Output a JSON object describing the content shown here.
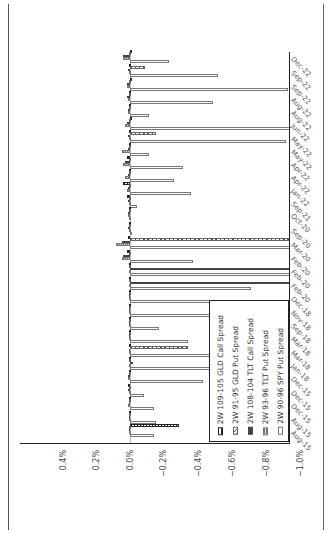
{
  "page": {
    "rotation": "90deg counter-clockwise"
  },
  "chart_data": {
    "type": "bar",
    "orientation": "rotated page; value axis horizontal along bottom, date axis vertical along right edge",
    "title": "",
    "xlabel": "",
    "ylabel": "",
    "ylim": [
      -1.0,
      0.4
    ],
    "y_ticks": [
      "0.4%",
      "0.2%",
      "0.0%",
      "−0.2%",
      "−0.4%",
      "−0.6%",
      "−0.8%",
      "−1.0%"
    ],
    "grid": false,
    "legend_position": "lower right (inside plot, rotated)",
    "categories": [
      "Dec-22",
      "Sep-22",
      "Sep-22",
      "Aug-22",
      "Aug-22",
      "Jun-22",
      "May-22",
      "May-22",
      "Apr-22",
      "Apr-22",
      "Jan-22",
      "Sep-21",
      "Oct-20",
      "Sep-20",
      "Mar-20",
      "Feb-20",
      "Feb-20",
      "Feb-20",
      "Dec-18",
      "Nov-18",
      "Sep-18",
      "Mar-18",
      "Mar-18",
      "Jan-18",
      "Dec-15",
      "Dec-15",
      "Dec-15",
      "Aug-15",
      "Aug-15"
    ],
    "series": [
      {
        "name": "2W 109-105 GLD Call Spread",
        "pattern": "dotted",
        "values": [
          -0.01,
          0.0,
          -0.01,
          0.0,
          0.0,
          -0.01,
          0.0,
          0.0,
          0.02,
          0.0,
          0.04,
          0.02,
          0.0,
          0.0,
          0.01,
          0.02,
          0.0,
          0.0,
          0.0,
          0.0,
          0.0,
          0.0,
          0.0,
          0.0,
          0.0,
          0.01,
          0.0,
          0.0,
          -0.29
        ]
      },
      {
        "name": "2W 91-95 GLD Put Spread",
        "pattern": "diagonal-hatch",
        "values": [
          0.0,
          -0.09,
          0.0,
          0.0,
          0.0,
          0.0,
          -0.15,
          0.0,
          0.0,
          0.0,
          0.0,
          0.0,
          0.0,
          0.0,
          -1.0,
          0.0,
          0.0,
          0.0,
          0.0,
          0.0,
          0.0,
          0.0,
          -0.34,
          0.0,
          0.0,
          0.0,
          0.0,
          0.0,
          0.0
        ]
      },
      {
        "name": "2W 108-104 TLT Call Spread",
        "pattern": "solid-dark",
        "values": [
          0.04,
          0.01,
          0.02,
          0.02,
          0.01,
          0.02,
          0.01,
          0.01,
          0.03,
          0.01,
          0.01,
          0.01,
          0.01,
          0.01,
          0.05,
          0.04,
          -1.0,
          -1.0,
          0.0,
          0.0,
          0.0,
          0.0,
          0.0,
          -0.02,
          0.01,
          0.01,
          0.0,
          0.0,
          0.0
        ]
      },
      {
        "name": "2W 93-96 TLT Put Spread",
        "pattern": "cross-hatch",
        "values": [
          0.04,
          0.0,
          0.02,
          0.01,
          0.01,
          0.03,
          0.0,
          0.05,
          0.04,
          0.03,
          0.02,
          0.0,
          0.01,
          0.0,
          0.08,
          0.05,
          0.0,
          0.0,
          0.0,
          0.0,
          0.0,
          0.0,
          0.0,
          0.0,
          0.01,
          0.0,
          0.01,
          0.0,
          0.0
        ]
      },
      {
        "name": "2W 90-96 SPY Put Spread",
        "pattern": "hollow",
        "values": [
          -0.23,
          -0.52,
          -0.93,
          -0.49,
          -0.11,
          -1.02,
          -0.92,
          -0.11,
          -0.31,
          -0.26,
          -0.36,
          -0.04,
          -0.0,
          -0.01,
          -1.0,
          -0.37,
          -1.0,
          -0.71,
          -0.89,
          -0.63,
          -0.17,
          -0.34,
          -0.58,
          -0.69,
          -0.43,
          -0.08,
          -0.14,
          -0.15,
          -0.14
        ]
      }
    ]
  },
  "axis": {
    "ticks": [
      {
        "label": "0.4%",
        "x": 63
      },
      {
        "label": "0.2%",
        "x": 96
      },
      {
        "label": "0.0%",
        "x": 130
      },
      {
        "label": "−0.2%",
        "x": 163
      },
      {
        "label": "−0.4%",
        "x": 198
      },
      {
        "label": "−0.6%",
        "x": 232
      },
      {
        "label": "−0.8%",
        "x": 266
      },
      {
        "label": "−1.0%",
        "x": 300
      }
    ],
    "dates": [
      {
        "label": "Dec-22",
        "y": 56
      },
      {
        "label": "Sep-22",
        "y": 70
      },
      {
        "label": "Sep-22",
        "y": 84
      },
      {
        "label": "Aug-22",
        "y": 97
      },
      {
        "label": "Aug-22",
        "y": 110
      },
      {
        "label": "Jun-22",
        "y": 123
      },
      {
        "label": "May-22",
        "y": 136
      },
      {
        "label": "May-22",
        "y": 149
      },
      {
        "label": "Apr-22",
        "y": 162
      },
      {
        "label": "Apr-22",
        "y": 175
      },
      {
        "label": "Jan-22",
        "y": 188
      },
      {
        "label": "Sep-21",
        "y": 201
      },
      {
        "label": "Oct-20",
        "y": 213
      },
      {
        "label": "Sep-20",
        "y": 228
      },
      {
        "label": "Mar-20",
        "y": 242
      },
      {
        "label": "Feb-20",
        "y": 256
      },
      {
        "label": "Feb-20",
        "y": 269
      },
      {
        "label": "Feb-20",
        "y": 283
      },
      {
        "label": "Dec-18",
        "y": 296
      },
      {
        "label": "Nov-18",
        "y": 310
      },
      {
        "label": "Sep-18",
        "y": 323
      },
      {
        "label": "Mar-18",
        "y": 336
      },
      {
        "label": "Mar-18",
        "y": 350
      },
      {
        "label": "Jan-18",
        "y": 363
      },
      {
        "label": "Dec-15",
        "y": 376
      },
      {
        "label": "Dec-15",
        "y": 390
      },
      {
        "label": "Dec-15",
        "y": 403
      },
      {
        "label": "Aug-15",
        "y": 417
      },
      {
        "label": "Aug-15",
        "y": 430
      }
    ]
  },
  "legend": {
    "items": [
      {
        "label": "2W 109-105 GLD Call Spread",
        "swatch": "s0"
      },
      {
        "label": "2W 91-95 GLD Put Spread",
        "swatch": "s1"
      },
      {
        "label": "2W 108-104 TLT Call Spread",
        "swatch": "s2"
      },
      {
        "label": "2W 93-96 TLT Put Spread",
        "swatch": "s3"
      },
      {
        "label": "2W 90-96 SPY Put Spread",
        "swatch": "s4"
      }
    ]
  },
  "colors": {
    "axis": "#222222",
    "bar_outline": "#777777",
    "dark_fill": "#444444",
    "background": "#ffffff"
  }
}
